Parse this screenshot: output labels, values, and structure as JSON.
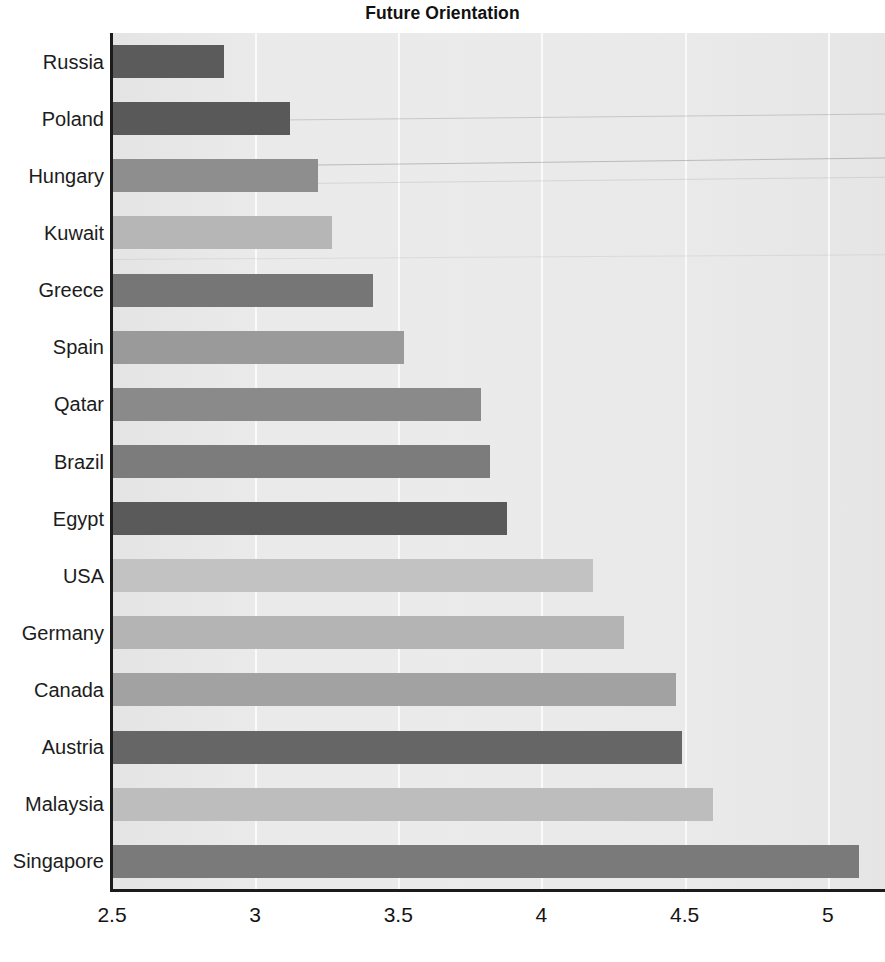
{
  "chart_data": {
    "type": "bar",
    "orientation": "horizontal",
    "title": "Future Orientation",
    "xlabel": "",
    "ylabel": "",
    "xlim": [
      2.5,
      5.2
    ],
    "ylim": null,
    "grid": true,
    "legend": null,
    "x_ticks": [
      "2.5",
      "3",
      "3.5",
      "4",
      "4.5",
      "5"
    ],
    "x_tick_values": [
      2.5,
      3,
      3.5,
      4,
      4.5,
      5
    ],
    "categories": [
      "Russia",
      "Poland",
      "Hungary",
      "Kuwait",
      "Greece",
      "Spain",
      "Qatar",
      "Brazil",
      "Egypt",
      "USA",
      "Germany",
      "Canada",
      "Austria",
      "Malaysia",
      "Singapore"
    ],
    "values": [
      2.89,
      3.12,
      3.22,
      3.27,
      3.41,
      3.52,
      3.79,
      3.82,
      3.88,
      4.18,
      4.29,
      4.47,
      4.49,
      4.6,
      5.11
    ],
    "bar_colors": [
      "#5b5b5b",
      "#595959",
      "#8e8e8e",
      "#b6b6b6",
      "#767676",
      "#9a9a9a",
      "#8a8a8a",
      "#7c7c7c",
      "#5a5a5a",
      "#c2c2c2",
      "#b4b4b4",
      "#a2a2a2",
      "#666666",
      "#bdbdbd",
      "#7a7a7a"
    ],
    "plot_background": "#eaeaea",
    "gridline_color": "#fbfbfb",
    "axis_color": "#1b1b1b"
  }
}
